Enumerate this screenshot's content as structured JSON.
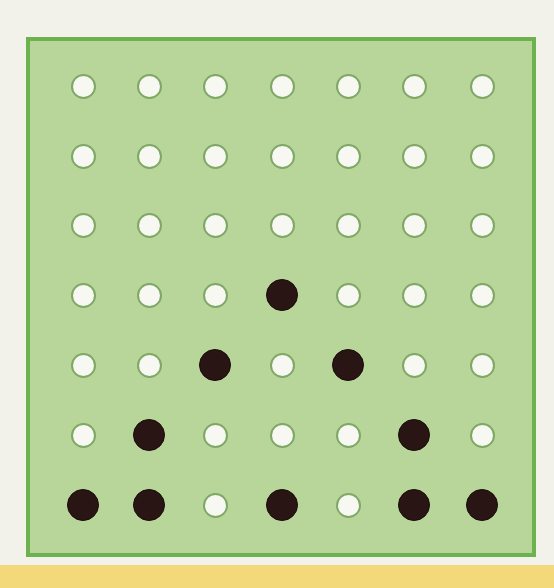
{
  "board": {
    "rows": 7,
    "cols": 7,
    "col_centers": [
      83,
      149,
      215,
      282,
      348,
      414,
      482
    ],
    "row_centers": [
      86,
      156,
      225,
      295,
      365,
      435,
      505
    ],
    "grid": [
      [
        "W",
        "W",
        "W",
        "W",
        "W",
        "W",
        "W"
      ],
      [
        "W",
        "W",
        "W",
        "W",
        "W",
        "W",
        "W"
      ],
      [
        "W",
        "W",
        "W",
        "W",
        "W",
        "W",
        "W"
      ],
      [
        "W",
        "W",
        "W",
        "B",
        "W",
        "W",
        "W"
      ],
      [
        "W",
        "W",
        "B",
        "W",
        "B",
        "W",
        "W"
      ],
      [
        "W",
        "B",
        "W",
        "W",
        "W",
        "B",
        "W"
      ],
      [
        "B",
        "B",
        "W",
        "B",
        "W",
        "B",
        "B"
      ]
    ],
    "legend": {
      "W": "empty-hole",
      "B": "black-peg"
    }
  },
  "colors": {
    "background": "#f2f1ea",
    "board_fill": "#b9d69a",
    "board_border": "#6cb34f",
    "hole_fill": "#f7f8f2",
    "hole_outline": "#7fa765",
    "peg_black": "#2a1515",
    "bottom_band": "#f3d97a"
  }
}
